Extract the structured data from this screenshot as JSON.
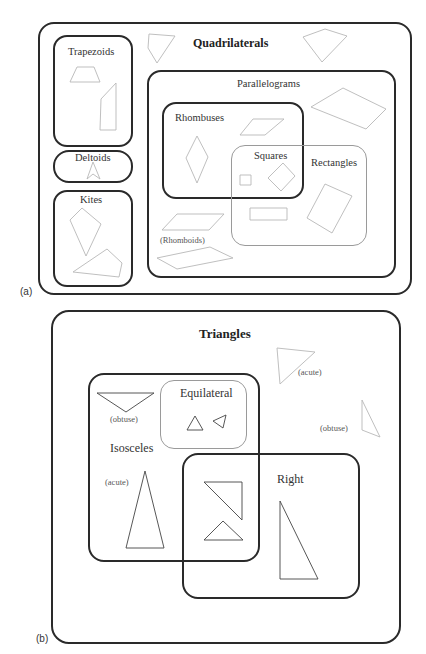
{
  "panel_a": {
    "tag": "(a)",
    "title": "Quadrilaterals",
    "sets": {
      "trapezoids": "Trapezoids",
      "deltoids": "Deltoids",
      "kites": "Kites",
      "parallelograms": "Parallelograms",
      "rhombuses": "Rhombuses",
      "squares": "Squares",
      "rectangles": "Rectangles",
      "rhomboids": "(Rhomboids)"
    }
  },
  "panel_b": {
    "tag": "(b)",
    "title": "Triangles",
    "sets": {
      "isosceles": "Isosceles",
      "equilateral": "Equilateral",
      "right": "Right"
    },
    "annotations": {
      "acute_outside": "(acute)",
      "obtuse_outside": "(obtuse)",
      "obtuse_isosceles": "(obtuse)",
      "acute_isosceles": "(acute)"
    }
  },
  "colors": {
    "dark_border": "#2a2a2a",
    "light_border": "#9a9a9a",
    "shape_stroke_light": "#b8b8b8",
    "shape_stroke_dark": "#444444"
  }
}
